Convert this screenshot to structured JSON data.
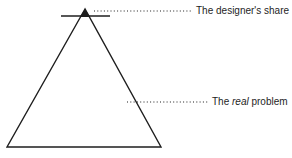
{
  "diagram": {
    "type": "triangle-iceberg",
    "shapes": {
      "triangle": {
        "apex": [
          85,
          9
        ],
        "bottom_left": [
          7,
          147
        ],
        "bottom_right": [
          161,
          147
        ]
      },
      "tip_bar": {
        "y": 16,
        "x1": 61,
        "x2": 110
      },
      "tip_fill": {
        "points": [
          [
            85,
            9
          ],
          [
            80,
            17
          ],
          [
            90,
            17
          ]
        ]
      }
    },
    "labels": [
      {
        "id": "designers-share",
        "text_before": "The designer's share",
        "leader_from": [
          93,
          11
        ],
        "leader_to": [
          192,
          11
        ]
      },
      {
        "id": "real-problem",
        "text_prefix": "The ",
        "text_italic": "real",
        "text_suffix": " problem",
        "leader_from": [
          126,
          103
        ],
        "leader_to": [
          208,
          103
        ]
      }
    ],
    "colors": {
      "stroke": "#1e1e1e",
      "background": "#ffffff"
    }
  }
}
